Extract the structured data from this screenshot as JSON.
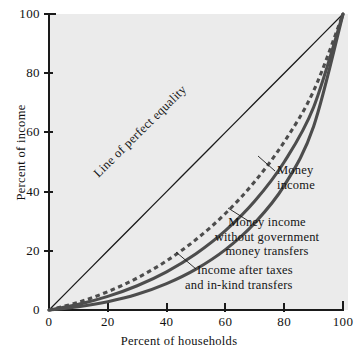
{
  "chart_data": {
    "type": "line",
    "title": "",
    "xlabel": "Percent of households",
    "ylabel": "Percent of income",
    "xlim": [
      0,
      100
    ],
    "ylim": [
      0,
      100
    ],
    "xticks": [
      0,
      20,
      40,
      60,
      80,
      100
    ],
    "yticks": [
      0,
      20,
      40,
      60,
      80,
      100
    ],
    "xtick_labels": [
      "0",
      "20",
      "40",
      "60",
      "80",
      "100"
    ],
    "ytick_labels": [
      "0",
      "20",
      "40",
      "60",
      "80",
      "100"
    ],
    "grid": false,
    "legend_position": "inline-annotations",
    "background_color": "#ebebeb",
    "axis_color": "#1a1a1a",
    "curve_color": "#4d4d4d",
    "series": [
      {
        "name": "Line of perfect equality",
        "style": "solid-thin",
        "color": "#1a1a1a",
        "x": [
          0,
          10,
          20,
          30,
          40,
          50,
          60,
          70,
          80,
          90,
          100
        ],
        "values": [
          0,
          10,
          20,
          30,
          40,
          50,
          60,
          70,
          80,
          90,
          100
        ]
      },
      {
        "name": "Income after taxes and in-kind transfers",
        "style": "dashed",
        "color": "#4d4d4d",
        "x": [
          0,
          10,
          20,
          30,
          40,
          50,
          60,
          70,
          80,
          90,
          100
        ],
        "values": [
          0,
          2.6,
          6.2,
          10.8,
          16.6,
          23.8,
          32.6,
          43.4,
          56.8,
          74.0,
          100
        ]
      },
      {
        "name": "Money income",
        "style": "solid-thick",
        "color": "#4d4d4d",
        "x": [
          0,
          10,
          20,
          30,
          40,
          50,
          60,
          70,
          80,
          90,
          100
        ],
        "values": [
          0,
          1.9,
          4.6,
          8.2,
          12.9,
          19.0,
          26.8,
          36.8,
          50.0,
          68.5,
          100
        ]
      },
      {
        "name": "Money income without government money transfers",
        "style": "solid-thick",
        "color": "#4d4d4d",
        "x": [
          0,
          10,
          20,
          30,
          40,
          50,
          60,
          70,
          80,
          90,
          100
        ],
        "values": [
          0,
          1.1,
          2.8,
          5.3,
          8.9,
          13.8,
          20.4,
          29.4,
          42.0,
          62.0,
          100
        ]
      }
    ],
    "annotations": [
      {
        "name": "line-of-perfect-equality",
        "text": "Line of perfect equality",
        "rotated": true,
        "angle_deg": -44.7
      },
      {
        "name": "money-income",
        "line1": "Money",
        "line2": "income",
        "leader": true
      },
      {
        "name": "money-income-without-government-money-transfers",
        "line1": "Money income",
        "line2": "without government",
        "line3": "money transfers",
        "leader": true
      },
      {
        "name": "income-after-taxes-and-in-kind-transfers",
        "line1": "Income after taxes",
        "line2": "and in-kind transfers",
        "leader": true
      }
    ]
  },
  "axes": {
    "x_title": "Percent of households",
    "y_title": "Percent of income",
    "x_ticks": [
      "0",
      "20",
      "40",
      "60",
      "80",
      "100"
    ],
    "y_ticks": [
      "0",
      "20",
      "40",
      "60",
      "80",
      "100"
    ]
  },
  "labels": {
    "equality": "Line of perfect equality",
    "money_income_l1": "Money",
    "money_income_l2": "income",
    "no_transfers_l1": "Money income",
    "no_transfers_l2": "without government",
    "no_transfers_l3": "money transfers",
    "after_taxes_l1": "Income after taxes",
    "after_taxes_l2": "and in-kind transfers"
  }
}
